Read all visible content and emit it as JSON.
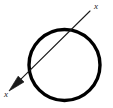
{
  "figure": {
    "name": "circle-with-transversal-axis",
    "background_color": "#ffffff",
    "width": 113,
    "height": 108
  },
  "chart_data": {
    "type": "diagram",
    "title": "",
    "xlabel": "",
    "ylabel": "",
    "shapes": [
      {
        "id": "circle",
        "kind": "circle",
        "center_x": 64.5,
        "center_y": 65,
        "radius": 35.5,
        "stroke_color": "#000000",
        "stroke_width": 3.4,
        "fill": "none"
      },
      {
        "id": "axis-line",
        "kind": "line",
        "x1": 90,
        "y1": 11,
        "x2": 11,
        "y2": 89,
        "stroke_color": "#1a1a1a",
        "stroke_width": 1.1,
        "arrow_start": false,
        "arrow_end": true
      },
      {
        "id": "arrowhead",
        "kind": "triangle",
        "tip_x": 9,
        "tip_y": 91,
        "stroke_color": "#1a1a1a",
        "fill": "#1a1a1a"
      }
    ],
    "annotations": [
      {
        "id": "label-upper-right",
        "text": "x",
        "x": 94,
        "y": 9,
        "anchor": "start"
      },
      {
        "id": "label-lower-left",
        "text": "x",
        "x": 4,
        "y": 97,
        "anchor": "start"
      }
    ]
  },
  "labels": {
    "upper_right": "x",
    "lower_left": "x"
  },
  "colors": {
    "stroke": "#000000",
    "line": "#1a1a1a",
    "background": "#ffffff"
  }
}
